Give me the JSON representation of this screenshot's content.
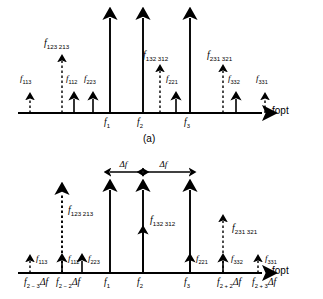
{
  "figure": {
    "axis_name": "fopt",
    "panel_a_tag": "(a)",
    "delta_label": "Δf"
  },
  "chart_data": {
    "type": "line",
    "xlabel": "fopt",
    "ylabel": "",
    "grid": false,
    "legend": "none",
    "panels": [
      {
        "id": "a",
        "tag": "(a)",
        "axis_y": 113,
        "axis_x_start": 18,
        "axis_x_end": 262,
        "lines": [
          {
            "name": "f113",
            "label": "f",
            "sub": "113",
            "x": 30,
            "height": 14,
            "style": "dashed",
            "label_x": 20,
            "label_y": 74
          },
          {
            "name": "f123213",
            "label": "f",
            "sub": "123 213",
            "x": 62,
            "height": 52,
            "style": "dashed",
            "label_x": 44,
            "label_y": 38
          },
          {
            "name": "f112",
            "label": "f",
            "sub": "112",
            "x": 74,
            "height": 14,
            "style": "solid",
            "label_x": 66,
            "label_y": 74
          },
          {
            "name": "f223",
            "label": "f",
            "sub": "223",
            "x": 93,
            "height": 14,
            "style": "solid",
            "label_x": 84,
            "label_y": 74
          },
          {
            "name": "f1",
            "label": "f",
            "sub": "1",
            "x": 110,
            "height": 95,
            "style": "solid",
            "label_x": 0,
            "label_y": 0
          },
          {
            "name": "f2",
            "label": "f",
            "sub": "2",
            "x": 143,
            "height": 95,
            "style": "solid",
            "label_x": 0,
            "label_y": 0
          },
          {
            "name": "f132312",
            "label": "f",
            "sub": "132 312",
            "x": 160,
            "height": 42,
            "style": "dashed",
            "label_x": 143,
            "label_y": 50
          },
          {
            "name": "f221",
            "label": "f",
            "sub": "221",
            "x": 176,
            "height": 14,
            "style": "solid",
            "label_x": 166,
            "label_y": 74
          },
          {
            "name": "f3",
            "label": "f",
            "sub": "3",
            "x": 190,
            "height": 95,
            "style": "solid",
            "label_x": 0,
            "label_y": 0
          },
          {
            "name": "f231321",
            "label": "f",
            "sub": "231 321",
            "x": 223,
            "height": 42,
            "style": "dashed",
            "label_x": 207,
            "label_y": 50
          },
          {
            "name": "f332",
            "label": "f",
            "sub": "332",
            "x": 236,
            "height": 14,
            "style": "solid",
            "label_x": 228,
            "label_y": 74
          },
          {
            "name": "f331",
            "label": "f",
            "sub": "331",
            "x": 265,
            "height": 14,
            "style": "dashed",
            "label_x": 256,
            "label_y": 74
          }
        ],
        "ticks": [
          {
            "name": "f1",
            "label": "f",
            "sub": "1",
            "x": 110
          },
          {
            "name": "f2",
            "label": "f",
            "sub": "2",
            "x": 143
          },
          {
            "name": "f3",
            "label": "f",
            "sub": "3",
            "x": 190
          }
        ]
      },
      {
        "id": "b",
        "tag": "",
        "axis_y": 273,
        "axis_x_start": 18,
        "axis_x_end": 262,
        "lines": [
          {
            "name": "f113",
            "label": "f",
            "sub": "113",
            "x": 30,
            "height": 12,
            "style": "dashed",
            "label_x": 36,
            "label_y": 254
          },
          {
            "name": "f123213",
            "label": "f",
            "sub": "123 213",
            "x": 62,
            "height": 80,
            "style": "dashed",
            "label_x": 68,
            "label_y": 205
          },
          {
            "name": "f112",
            "label": "f",
            "sub": "112",
            "x": 62,
            "height": 12,
            "style": "solid",
            "label_x": 68,
            "label_y": 254
          },
          {
            "name": "f223",
            "label": "f",
            "sub": "223",
            "x": 82,
            "height": 12,
            "style": "solid",
            "label_x": 88,
            "label_y": 254
          },
          {
            "name": "f1",
            "label": "f",
            "sub": "1",
            "x": 110,
            "height": 83,
            "style": "solid",
            "label_x": 0,
            "label_y": 0
          },
          {
            "name": "f2",
            "label": "f",
            "sub": "2",
            "x": 143,
            "height": 83,
            "style": "solid",
            "label_x": 0,
            "label_y": 0
          },
          {
            "name": "f132312",
            "label": "f",
            "sub": "132 312",
            "x": 143,
            "height": 40,
            "style": "solid",
            "label_x": 150,
            "label_y": 215
          },
          {
            "name": "f3",
            "label": "f",
            "sub": "3",
            "x": 190,
            "height": 83,
            "style": "solid",
            "label_x": 0,
            "label_y": 0
          },
          {
            "name": "f221",
            "label": "f",
            "sub": "221",
            "x": 190,
            "height": 12,
            "style": "solid",
            "label_x": 196,
            "label_y": 254
          },
          {
            "name": "f231321",
            "label": "f",
            "sub": "231 321",
            "x": 223,
            "height": 52,
            "style": "dashed",
            "label_x": 232,
            "label_y": 223
          },
          {
            "name": "f332",
            "label": "f",
            "sub": "332",
            "x": 223,
            "height": 12,
            "style": "solid",
            "label_x": 231,
            "label_y": 254
          },
          {
            "name": "f331",
            "label": "f",
            "sub": "331",
            "x": 258,
            "height": 12,
            "style": "dashed",
            "label_x": 265,
            "label_y": 254
          }
        ],
        "ticks": [
          {
            "name": "f2-3df",
            "label": "f",
            "sub": "2 − 3",
            "suffix": "Δf",
            "x": 30
          },
          {
            "name": "f2-2df",
            "label": "f",
            "sub": "2 − 2",
            "suffix": "Δf",
            "x": 62
          },
          {
            "name": "f1",
            "label": "f",
            "sub": "1",
            "suffix": "",
            "x": 110
          },
          {
            "name": "f2",
            "label": "f",
            "sub": "2",
            "suffix": "",
            "x": 143
          },
          {
            "name": "f3",
            "label": "f",
            "sub": "3",
            "suffix": "",
            "x": 190
          },
          {
            "name": "f2+2df",
            "label": "f",
            "sub": "2 + 2",
            "suffix": "Δf",
            "x": 223
          },
          {
            "name": "f2+3df",
            "label": "f",
            "sub": "2 + 3",
            "suffix": "Δf",
            "x": 258
          }
        ],
        "spans": [
          {
            "name": "delta-f-span-1",
            "label": "Δf",
            "x1": 110,
            "x2": 143,
            "y": 172
          },
          {
            "name": "delta-f-span-2",
            "label": "Δf",
            "x1": 143,
            "x2": 190,
            "y": 172
          }
        ]
      }
    ]
  }
}
